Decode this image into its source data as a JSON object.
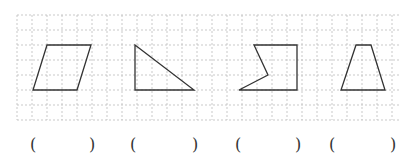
{
  "grid": {
    "x0": 17,
    "y0": 15,
    "x1": 400,
    "y1": 120,
    "cell": 15,
    "line_color": "#bbbbbb"
  },
  "shapes": [
    {
      "name": "parallelogram",
      "points": "47,45 91,45 77,90 33,90"
    },
    {
      "name": "right-triangle",
      "points": "135,45 194,90 135,90"
    },
    {
      "name": "concave-pentagon",
      "points": "254,45 297,45 297,90 239,90 268,75"
    },
    {
      "name": "trapezoid",
      "points": "356,45 371,45 385,90 341,90"
    }
  ],
  "stroke_color": "#333333",
  "answers": [
    {
      "open": "(",
      "close": ")",
      "open_x": 30,
      "close_x": 89
    },
    {
      "open": "(",
      "close": ")",
      "open_x": 130,
      "close_x": 192
    },
    {
      "open": "(",
      "close": ")",
      "open_x": 235,
      "close_x": 295
    },
    {
      "open": "(",
      "close": ")",
      "open_x": 329,
      "close_x": 390
    }
  ]
}
